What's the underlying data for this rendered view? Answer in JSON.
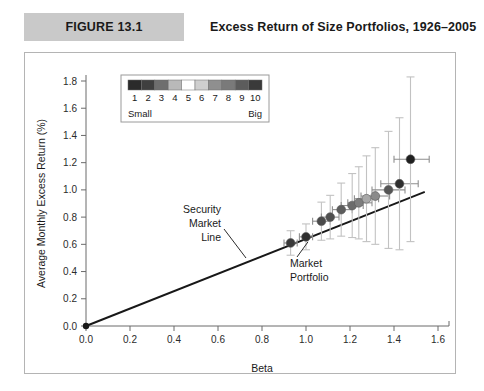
{
  "figure": {
    "tag": "FIGURE 13.1",
    "title": "Excess Return of Size Portfolios, 1926–2005"
  },
  "legend": {
    "position": "inside-top-left",
    "left_label": "Small",
    "right_label": "Big",
    "bin_labels": [
      "1",
      "2",
      "3",
      "4",
      "5",
      "6",
      "7",
      "8",
      "9",
      "10"
    ],
    "swatch_colors": [
      "#2b2b2b",
      "#3f3f3f",
      "#6e6e6e",
      "#b9b9b9",
      "#ffffff",
      "#cfcfcf",
      "#8f8f8f",
      "#7a7a7a",
      "#5c5c5c",
      "#3a3a3a"
    ]
  },
  "annotations": [
    {
      "name": "security-market-line",
      "lines": [
        "Security",
        "Market",
        "Line"
      ]
    },
    {
      "name": "market-portfolio",
      "lines": [
        "Market",
        "Portfolio"
      ]
    }
  ],
  "chart_data": {
    "type": "scatter",
    "title": "Excess Return of Size Portfolios, 1926–2005",
    "xlabel": "Beta",
    "ylabel": "Average Monthly Excess Return (%)",
    "xlim": [
      0.0,
      1.6
    ],
    "ylim": [
      0.0,
      1.8
    ],
    "xticks": [
      "0.0",
      "0.2",
      "0.4",
      "0.6",
      "0.8",
      "1.0",
      "1.2",
      "1.4",
      "1.6"
    ],
    "yticks": [
      "0.0",
      "0.2",
      "0.4",
      "0.6",
      "0.8",
      "1.0",
      "1.2",
      "1.4",
      "1.6",
      "1.8"
    ],
    "grid": false,
    "legend_position": "upper left",
    "series": [
      {
        "name": "Size portfolios (decile 10 = Big → decile 1 = Small)",
        "points": [
          {
            "label": "10",
            "x": 0.93,
            "y": 0.61,
            "y_low": 0.52,
            "y_high": 0.7,
            "x_low": 0.9,
            "x_high": 0.96,
            "color": "#3a3a3a"
          },
          {
            "label": "9",
            "x": 1.0,
            "y": 0.655,
            "y_low": 0.56,
            "y_high": 0.75,
            "x_low": 0.97,
            "x_high": 1.03,
            "color": "#2f2f2f"
          },
          {
            "label": "8",
            "x": 1.07,
            "y": 0.77,
            "y_low": 0.63,
            "y_high": 0.91,
            "x_low": 1.03,
            "x_high": 1.11,
            "color": "#4a4a4a"
          },
          {
            "label": "7",
            "x": 1.11,
            "y": 0.8,
            "y_low": 0.64,
            "y_high": 0.96,
            "x_low": 1.07,
            "x_high": 1.15,
            "color": "#4f4f4f"
          },
          {
            "label": "6",
            "x": 1.16,
            "y": 0.855,
            "y_low": 0.66,
            "y_high": 1.05,
            "x_low": 1.12,
            "x_high": 1.21,
            "color": "#5c5c5c"
          },
          {
            "label": "5",
            "x": 1.21,
            "y": 0.885,
            "y_low": 0.65,
            "y_high": 1.12,
            "x_low": 1.16,
            "x_high": 1.26,
            "color": "#6b6b6b"
          },
          {
            "label": "4",
            "x": 1.24,
            "y": 0.905,
            "y_low": 0.64,
            "y_high": 1.17,
            "x_low": 1.19,
            "x_high": 1.3,
            "color": "#7d7d7d"
          },
          {
            "label": "3",
            "x": 1.275,
            "y": 0.935,
            "y_low": 0.62,
            "y_high": 1.25,
            "x_low": 1.22,
            "x_high": 1.33,
            "color": "#a8a8a8"
          },
          {
            "label": "2",
            "x": 1.315,
            "y": 0.955,
            "y_low": 0.6,
            "y_high": 1.31,
            "x_low": 1.25,
            "x_high": 1.38,
            "color": "#8a8a8a"
          },
          {
            "label": "1b",
            "x": 1.375,
            "y": 1.0,
            "y_low": 0.57,
            "y_high": 1.43,
            "x_low": 1.3,
            "x_high": 1.45,
            "color": "#555555"
          },
          {
            "label": "1a",
            "x": 1.425,
            "y": 1.045,
            "y_low": 0.56,
            "y_high": 1.53,
            "x_low": 1.34,
            "x_high": 1.51,
            "color": "#2e2e2e"
          },
          {
            "label": "1",
            "x": 1.475,
            "y": 1.225,
            "y_low": 0.62,
            "y_high": 1.83,
            "x_low": 1.4,
            "x_high": 1.56,
            "color": "#1f1f1f"
          }
        ]
      }
    ],
    "reference_line": {
      "name": "Security Market Line",
      "x0": 0.0,
      "y0": 0.0,
      "x1": 1.54,
      "y1": 0.985
    },
    "origin_marker": {
      "x": 0.0,
      "y": 0.0
    }
  }
}
